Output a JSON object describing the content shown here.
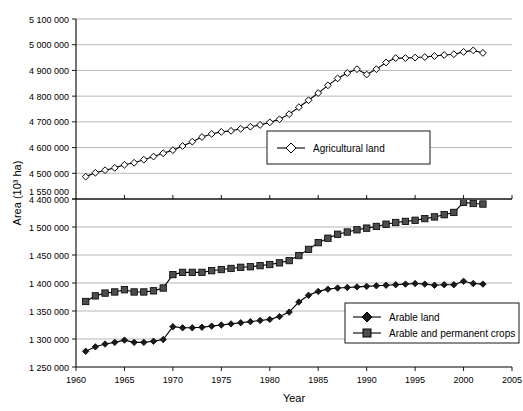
{
  "chart_data": {
    "type": "line",
    "title": "",
    "xlabel": "Year",
    "ylabel": "Area (10³ ha)",
    "xlim": [
      1960,
      2005
    ],
    "x_ticks": [
      1960,
      1965,
      1970,
      1975,
      1980,
      1985,
      1990,
      1995,
      2000,
      2005
    ],
    "x_tick_labels": [
      "1960",
      "1965",
      "1970",
      "1975",
      "1980",
      "1985",
      "1990",
      "1995",
      "2000",
      "2005"
    ],
    "broken_axis": true,
    "upper_panel": {
      "ylim": [
        4400000,
        5100000
      ],
      "y_ticks": [
        4400000,
        4500000,
        4600000,
        4700000,
        4800000,
        4900000,
        5000000,
        5100000
      ],
      "y_tick_labels": [
        "4 400 000",
        "4 500 000",
        "4 600 000",
        "4 700 000",
        "4 800 000",
        "4 900 000",
        "5 000 000",
        "5 100 000"
      ]
    },
    "lower_panel": {
      "ylim": [
        1250000,
        1550000
      ],
      "y_ticks": [
        1250000,
        1300000,
        1350000,
        1400000,
        1450000,
        1500000,
        1550000
      ],
      "y_tick_labels": [
        "1 250 000",
        "1 300 000",
        "1 350 000",
        "1 400 000",
        "1 450 000",
        "1 500 000",
        "1 550 000"
      ]
    },
    "grid": true,
    "legend_position": "inside",
    "x": [
      1961,
      1962,
      1963,
      1964,
      1965,
      1966,
      1967,
      1968,
      1969,
      1970,
      1971,
      1972,
      1973,
      1974,
      1975,
      1976,
      1977,
      1978,
      1979,
      1980,
      1981,
      1982,
      1983,
      1984,
      1985,
      1986,
      1987,
      1988,
      1989,
      1990,
      1991,
      1992,
      1993,
      1994,
      1995,
      1996,
      1997,
      1998,
      1999,
      2000,
      2001,
      2002
    ],
    "series": [
      {
        "name": "Agricultural land",
        "panel": "upper",
        "marker": "open-diamond",
        "values": [
          4487000,
          4502000,
          4512000,
          4521000,
          4533000,
          4541000,
          4553000,
          4565000,
          4578000,
          4590000,
          4606000,
          4623000,
          4641000,
          4653000,
          4661000,
          4665000,
          4673000,
          4681000,
          4688000,
          4698000,
          4710000,
          4730000,
          4757000,
          4784000,
          4812000,
          4842000,
          4869000,
          4890000,
          4905000,
          4884000,
          4905000,
          4931000,
          4948000,
          4948000,
          4950000,
          4952000,
          4956000,
          4960000,
          4963000,
          4972000,
          4978000,
          4968000
        ]
      },
      {
        "name": "Arable and permanent crops",
        "panel": "lower",
        "marker": "filled-square",
        "values": [
          1367000,
          1377000,
          1382000,
          1384000,
          1388000,
          1384000,
          1384000,
          1386000,
          1391000,
          1415000,
          1419000,
          1419000,
          1419000,
          1422000,
          1424000,
          1426000,
          1428000,
          1429000,
          1431000,
          1433000,
          1436000,
          1440000,
          1449000,
          1460000,
          1472000,
          1480000,
          1487000,
          1491000,
          1495000,
          1498000,
          1501000,
          1505000,
          1508000,
          1510000,
          1512000,
          1515000,
          1518000,
          1522000,
          1526000,
          1544000,
          1542000,
          1541000
        ]
      },
      {
        "name": "Arable land",
        "panel": "lower",
        "marker": "filled-diamond",
        "values": [
          1278000,
          1286000,
          1291000,
          1294000,
          1298000,
          1294000,
          1294000,
          1296000,
          1299000,
          1322000,
          1320000,
          1320000,
          1321000,
          1323000,
          1325000,
          1327000,
          1329000,
          1331000,
          1333000,
          1335000,
          1340000,
          1348000,
          1366000,
          1378000,
          1385000,
          1389000,
          1391000,
          1392000,
          1393000,
          1394000,
          1395000,
          1396000,
          1397000,
          1398000,
          1399000,
          1398000,
          1396000,
          1397000,
          1397000,
          1403000,
          1399000,
          1398000
        ]
      }
    ],
    "legends": [
      {
        "id": "legend-upper",
        "entries": [
          {
            "label": "Agricultural land",
            "marker": "open-diamond"
          }
        ]
      },
      {
        "id": "legend-lower",
        "entries": [
          {
            "label": "Arable land",
            "marker": "filled-diamond"
          },
          {
            "label": "Arable and permanent crops",
            "marker": "filled-square"
          }
        ]
      }
    ],
    "colors": {
      "line": "#000000",
      "grid": "#9a9a9a",
      "marker_fill": "#4d4d4d",
      "background": "#ffffff"
    }
  }
}
